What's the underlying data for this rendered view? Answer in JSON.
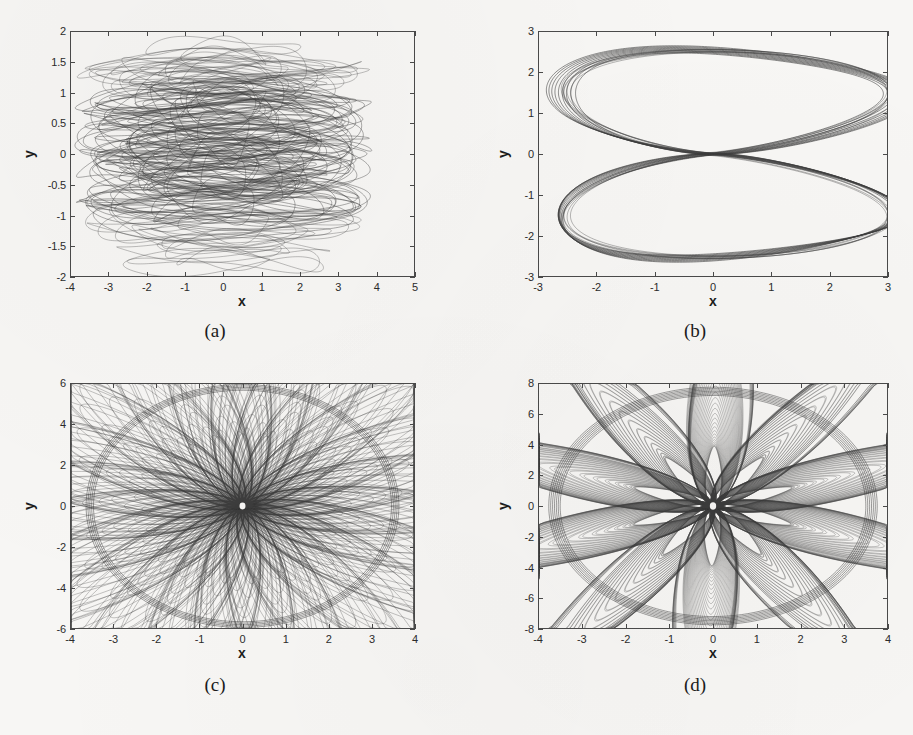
{
  "figure": {
    "background_color": "#f7f6f4",
    "line_color": "#3c3c3c",
    "axis_color": "#4a4a4a"
  },
  "panels": [
    {
      "caption": "(a)",
      "xlabel": "x",
      "ylabel": "y",
      "xticks": [
        "-4",
        "-3",
        "-2",
        "-1",
        "0",
        "1",
        "2",
        "3",
        "4",
        "5"
      ],
      "yticks": [
        "-2",
        "-1.5",
        "-1",
        "-0.5",
        "0",
        "0.5",
        "1",
        "1.5",
        "2"
      ]
    },
    {
      "caption": "(b)",
      "xlabel": "x",
      "ylabel": "y",
      "xticks": [
        "-3",
        "-2",
        "-1",
        "0",
        "1",
        "2",
        "3"
      ],
      "yticks": [
        "-3",
        "-2",
        "-1",
        "0",
        "1",
        "2",
        "3"
      ]
    },
    {
      "caption": "(c)",
      "xlabel": "x",
      "ylabel": "y",
      "xticks": [
        "-4",
        "-3",
        "-2",
        "-1",
        "0",
        "1",
        "2",
        "3",
        "4"
      ],
      "yticks": [
        "-6",
        "-4",
        "-2",
        "0",
        "2",
        "4",
        "6"
      ]
    },
    {
      "caption": "(d)",
      "xlabel": "x",
      "ylabel": "y",
      "xticks": [
        "-4",
        "-3",
        "-2",
        "-1",
        "0",
        "1",
        "2",
        "3",
        "4"
      ],
      "yticks": [
        "-8",
        "-6",
        "-4",
        "-2",
        "0",
        "2",
        "4",
        "6",
        "8"
      ]
    }
  ],
  "chart_data": [
    {
      "type": "line",
      "panel": "(a)",
      "title": "",
      "xlabel": "x",
      "ylabel": "y",
      "xlim": [
        -4,
        5
      ],
      "ylim": [
        -2,
        2
      ],
      "xticks": [
        -4,
        -3,
        -2,
        -1,
        0,
        1,
        2,
        3,
        4,
        5
      ],
      "yticks": [
        -2,
        -1.5,
        -1,
        -0.5,
        0,
        0.5,
        1,
        1.5,
        2
      ],
      "grid": false,
      "legend": "none",
      "description": "Dense chaotic phase portrait: many flattened, horizontally elongated overlapping loops centred near the origin. Trajectory spans roughly x in [-3.6, 4.2] and y in [-1.7, 1.85], with the densest black band between y = -1 and y = 1 and sparse outer loops near y = +/-1.5.",
      "extent": {
        "x_min": -3.6,
        "x_max": 4.2,
        "y_min": -1.7,
        "y_max": 1.85
      },
      "dense_core": {
        "x_min": -3.3,
        "x_max": 3.3,
        "y_min": -1.0,
        "y_max": 1.0
      }
    },
    {
      "type": "line",
      "panel": "(b)",
      "title": "",
      "xlabel": "x",
      "ylabel": "y",
      "xlim": [
        -3,
        3
      ],
      "ylim": [
        -3,
        3
      ],
      "xticks": [
        -3,
        -2,
        -1,
        0,
        1,
        2,
        3
      ],
      "yticks": [
        -3,
        -2,
        -1,
        0,
        1,
        2,
        3
      ],
      "grid": false,
      "legend": "none",
      "description": "Quasi-periodic hourglass / figure-eight shaped orbit bundle. A narrow band of about 6-8 nearly coincident closed curves forms an upper lobe peaking near y = 2.6 and a lower lobe reaching y = -2.6, pinched to a waist crossing near the origin. Lateral extent roughly x in [-2.6, 2.6].",
      "extent": {
        "x_min": -2.6,
        "x_max": 2.6,
        "y_min": -2.65,
        "y_max": 2.65
      },
      "waist": {
        "x": 0,
        "y": 0
      },
      "n_bands": 7
    },
    {
      "type": "line",
      "panel": "(c)",
      "title": "",
      "xlabel": "x",
      "ylabel": "y",
      "xlim": [
        -4,
        4
      ],
      "ylim": [
        -6,
        6
      ],
      "xticks": [
        -4,
        -3,
        -2,
        -1,
        0,
        1,
        2,
        3,
        4
      ],
      "yticks": [
        -6,
        -4,
        -2,
        0,
        2,
        4,
        6
      ],
      "grid": false,
      "legend": "none",
      "description": "Dense filled elliptical (toroidal) attractor. Hundreds of rotating, slowly precessing loops fill an ellipse spanning x in [-3.6, 3.6] and y in [-5.8, 5.9], leaving a small white hole at the centre near (0, 0) and producing a moire-like texture of nested arcs.",
      "extent": {
        "x_min": -3.6,
        "x_max": 3.6,
        "y_min": -5.8,
        "y_max": 5.9
      },
      "center_hole": {
        "x": 0,
        "y": 0,
        "rx": 0.12,
        "ry": 0.18
      }
    },
    {
      "type": "line",
      "panel": "(d)",
      "title": "",
      "xlabel": "x",
      "ylabel": "y",
      "xlim": [
        -4,
        4
      ],
      "ylim": [
        -8,
        8
      ],
      "xticks": [
        -4,
        -3,
        -2,
        -1,
        0,
        1,
        2,
        3,
        4
      ],
      "yticks": [
        -8,
        -6,
        -4,
        -2,
        0,
        2,
        4,
        6,
        8
      ],
      "grid": false,
      "legend": "none",
      "description": "Dense filled elliptical attractor similar to (c) but larger in y. Precessing loops fill an ellipse spanning x in [-3.7, 3.7] and y in [-7.6, 7.6], with prominent tilted outer envelope loops, checkerboard moire bands and a small white hole at the centre near (0, 0).",
      "extent": {
        "x_min": -3.7,
        "x_max": 3.7,
        "y_min": -7.6,
        "y_max": 7.6
      },
      "center_hole": {
        "x": 0,
        "y": 0,
        "rx": 0.13,
        "ry": 0.22
      }
    }
  ]
}
